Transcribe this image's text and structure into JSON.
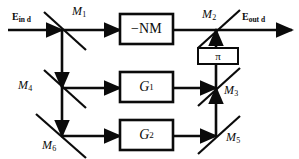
{
  "diagram": {
    "canvas": {
      "width": 299,
      "height": 159,
      "background": "#ffffff",
      "stroke": "#0b0b0b"
    },
    "fields": {
      "input": {
        "symbol": "E",
        "subscript": "in d",
        "name": "input-field-label"
      },
      "output": {
        "symbol": "E",
        "subscript": "out d",
        "name": "output-field-label"
      }
    },
    "mirrors": [
      {
        "id": "M1",
        "symbol": "M",
        "subscript": "1",
        "x": 62,
        "y": 30,
        "label_x": 72,
        "label_y": 5
      },
      {
        "id": "M2",
        "symbol": "M",
        "subscript": "2",
        "x": 216,
        "y": 30,
        "label_x": 202,
        "label_y": 8
      },
      {
        "id": "M3",
        "symbol": "M",
        "subscript": "3",
        "x": 216,
        "y": 88,
        "label_x": 226,
        "label_y": 84
      },
      {
        "id": "M4",
        "symbol": "M",
        "subscript": "4",
        "x": 62,
        "y": 88,
        "label_x": 18,
        "label_y": 78
      },
      {
        "id": "M5",
        "symbol": "M",
        "subscript": "5",
        "x": 216,
        "y": 136,
        "label_x": 226,
        "label_y": 131
      },
      {
        "id": "M6",
        "symbol": "M",
        "subscript": "6",
        "x": 62,
        "y": 136,
        "label_x": 44,
        "label_y": 140
      }
    ],
    "boxes": [
      {
        "id": "NM",
        "label": "−NM",
        "x": 120,
        "y": 14,
        "w": 53,
        "h": 30,
        "style": "nm"
      },
      {
        "id": "G1",
        "label": "G",
        "subscript": "1",
        "x": 120,
        "y": 72,
        "w": 53,
        "h": 30,
        "style": "g"
      },
      {
        "id": "G2",
        "label": "G",
        "subscript": "2",
        "x": 120,
        "y": 120,
        "w": 53,
        "h": 30,
        "style": "g"
      },
      {
        "id": "PI",
        "label": "π",
        "x": 198,
        "y": 48,
        "w": 40,
        "h": 16,
        "style": "pi"
      }
    ],
    "paths": [
      {
        "name": "input-beam",
        "from": "E_in d",
        "to": "M1"
      },
      {
        "name": "m1-to-nm",
        "from": "M1",
        "to": "NM"
      },
      {
        "name": "nm-to-m2",
        "from": "NM",
        "to": "M2"
      },
      {
        "name": "m2-to-output",
        "from": "M2",
        "to": "E_out d"
      },
      {
        "name": "m1-to-m4-to-m6",
        "from": "M1",
        "to": "M6"
      },
      {
        "name": "m4-to-g1",
        "from": "M4",
        "to": "G1"
      },
      {
        "name": "g1-to-m3",
        "from": "G1",
        "to": "M3"
      },
      {
        "name": "m6-to-g2",
        "from": "M6",
        "to": "G2"
      },
      {
        "name": "g2-to-m5",
        "from": "G2",
        "to": "M5"
      },
      {
        "name": "m5-to-m3",
        "from": "M5",
        "to": "M3"
      },
      {
        "name": "m3-through-pi-to-m2",
        "from": "M3",
        "to": "M2"
      }
    ]
  }
}
